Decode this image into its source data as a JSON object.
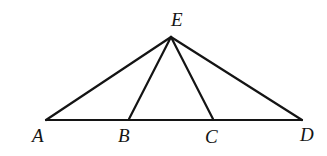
{
  "figure": {
    "kind": "geometry-diagram",
    "canvas": {
      "width": 327,
      "height": 156,
      "background": "#ffffff"
    },
    "style": {
      "stroke_color": "#141414",
      "stroke_width": 2.2,
      "label_color": "#141414",
      "label_font_size": 19
    },
    "points": [
      {
        "id": "E",
        "label": "E",
        "x": 171,
        "y": 37,
        "label_x": 178,
        "label_y": 20,
        "role": "apex"
      },
      {
        "id": "A",
        "label": "A",
        "x": 46,
        "y": 120,
        "label_x": 39,
        "label_y": 136,
        "role": "base-left-endpoint"
      },
      {
        "id": "B",
        "label": "B",
        "x": 129,
        "y": 119,
        "label_x": 125,
        "label_y": 136,
        "role": "base-interior-point"
      },
      {
        "id": "C",
        "label": "C",
        "x": 213,
        "y": 119,
        "label_x": 212,
        "label_y": 137,
        "role": "base-interior-point"
      },
      {
        "id": "D",
        "label": "D",
        "x": 302,
        "y": 120,
        "label_x": 307,
        "label_y": 135,
        "role": "base-right-endpoint"
      }
    ],
    "segments": [
      {
        "id": "AD",
        "name": "base-line-a-d",
        "from": "A",
        "to": "D"
      },
      {
        "id": "EA",
        "name": "segment-e-a",
        "from": "E",
        "to": "A"
      },
      {
        "id": "EB",
        "name": "segment-e-b",
        "from": "E",
        "to": "B"
      },
      {
        "id": "EC",
        "name": "segment-e-c",
        "from": "E",
        "to": "C"
      },
      {
        "id": "ED",
        "name": "segment-e-d",
        "from": "E",
        "to": "D"
      }
    ],
    "labels": {
      "E": "E",
      "A": "A",
      "B": "B",
      "C": "C",
      "D": "D"
    }
  }
}
